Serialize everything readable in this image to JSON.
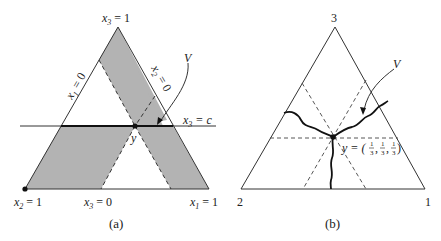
{
  "figure": {
    "panel_a": {
      "caption": "(a)",
      "vertex_labels": {
        "top": {
          "var": "x",
          "sub": "3",
          "rest": " = 1"
        },
        "bottom_left": {
          "var": "x",
          "sub": "2",
          "rest": " = 1"
        },
        "bottom_right": {
          "var": "x",
          "sub": "1",
          "rest": " = 1"
        }
      },
      "edge_labels": {
        "left": {
          "var": "x",
          "sub": "1",
          "rest": " = 0"
        },
        "right": {
          "var": "x",
          "sub": "2",
          "rest": " = 0"
        },
        "bottom": {
          "var": "x",
          "sub": "3",
          "rest": " = 0"
        }
      },
      "line_label": {
        "var": "x",
        "sub": "3",
        "rest": " = c"
      },
      "point_label": "y",
      "set_label": "V",
      "shade_color": "#b3b3b3"
    },
    "panel_b": {
      "caption": "(b)",
      "vertex_labels": {
        "top": "3",
        "bottom_left": "2",
        "bottom_right": "1"
      },
      "point_label": "y = (1/3, 1/3, 1/3)",
      "point_label_parts": {
        "prefix": "y = (",
        "num": "1",
        "den": "3",
        "suffix": ")"
      },
      "set_label": "V"
    }
  }
}
